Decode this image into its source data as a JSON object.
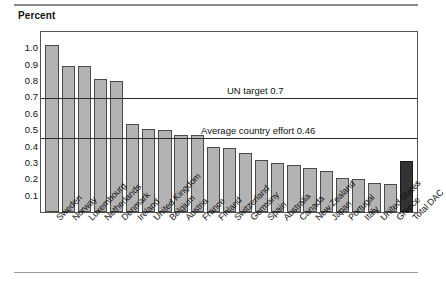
{
  "axis_title": "Percent",
  "chart_data": {
    "type": "bar",
    "title": "",
    "subtitle": "",
    "xlabel": "",
    "ylabel": "Percent",
    "ylim": [
      0,
      1.1
    ],
    "yticks": [
      0.1,
      0.2,
      0.3,
      0.4,
      0.5,
      0.6,
      0.7,
      0.8,
      0.9,
      1.0
    ],
    "ytick_labels": [
      "0.1",
      "0.2",
      "0.3",
      "0.4",
      "0.5",
      "0.6",
      "0.7",
      "0.8",
      "0.9",
      "1.0"
    ],
    "grid": false,
    "legend": "none",
    "categories": [
      "Sweden",
      "Norway",
      "Luxembourg",
      "Netherlands",
      "Denmark",
      "Ireland",
      "United Kingdom",
      "Belgium",
      "Austria",
      "France",
      "Finland",
      "Switzerland",
      "Germany",
      "Spain",
      "Australia",
      "Canada",
      "New Zealand",
      "Japan",
      "Portugal",
      "Italy",
      "United States",
      "Greece",
      "Total DAC"
    ],
    "values": [
      1.02,
      0.89,
      0.89,
      0.81,
      0.8,
      0.54,
      0.51,
      0.5,
      0.47,
      0.47,
      0.4,
      0.39,
      0.36,
      0.32,
      0.3,
      0.29,
      0.27,
      0.25,
      0.21,
      0.2,
      0.18,
      0.17,
      0.31
    ],
    "highlight_index": 22,
    "bar_color": "#b3b3b3",
    "highlight_color": "#333333",
    "bar_edge_color": "#4a4a4a",
    "annotations": [
      {
        "label": "UN target 0.7",
        "value": 0.7
      },
      {
        "label": "Average country effort 0.46",
        "value": 0.46
      }
    ]
  }
}
